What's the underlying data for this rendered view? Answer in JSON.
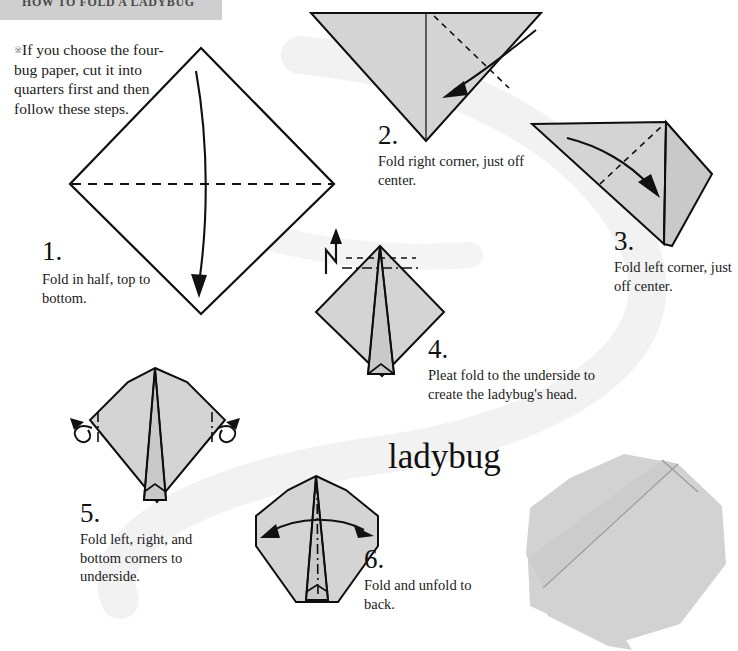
{
  "page": {
    "header_title": "HOW TO FOLD A LADYBUG",
    "model_name": "ladybug",
    "background_color": "#ffffff",
    "header_bar_color": "#cfcfcf",
    "paper_color": "#d4d4d4",
    "line_color": "#0d0d0d"
  },
  "intro": {
    "bullet": "※",
    "text": "If you choose the four-bug paper, cut it into quarters first and then follow these steps."
  },
  "steps": [
    {
      "number": "1.",
      "caption": "Fold in half, top to bottom.",
      "diagram": "white-diamond-with-horizontal-valley-fold",
      "fold_type": "valley",
      "arrow": "curved-down"
    },
    {
      "number": "2.",
      "caption": "Fold right corner, just off center.",
      "diagram": "gray-downward-triangle",
      "fold_type": "valley",
      "arrow": "curved-left-down"
    },
    {
      "number": "3.",
      "caption": "Fold left corner, just off center.",
      "diagram": "gray-triangle-with-right-flap",
      "fold_type": "valley",
      "arrow": "curved-right-down"
    },
    {
      "number": "4.",
      "caption": "Pleat fold to the underside to create the ladybug's head.",
      "diagram": "gray-diamond-with-center-spike",
      "fold_type": "pleat",
      "arrow": "zigzag-up"
    },
    {
      "number": "5.",
      "caption": "Fold left, right, and bottom corners to underside.",
      "diagram": "gray-body-with-side-mountain-folds",
      "fold_type": "mountain",
      "arrow": "curl-both-sides"
    },
    {
      "number": "6.",
      "caption": "Fold and unfold to back.",
      "diagram": "gray-ladybug-body-with-center-line",
      "fold_type": "mountain",
      "arrow": "double-headed-horizontal"
    }
  ],
  "finished_model": {
    "label": "finished-ladybug-photo",
    "color": "#d2d2d2"
  }
}
